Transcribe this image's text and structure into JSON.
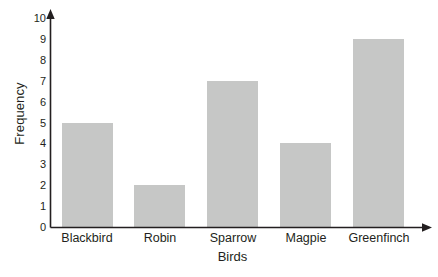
{
  "chart_data": {
    "type": "bar",
    "title": "",
    "subtitle": "",
    "categories": [
      "Blackbird",
      "Robin",
      "Sparrow",
      "Magpie",
      "Greenfinch"
    ],
    "values": [
      5,
      2,
      7,
      4,
      9
    ],
    "xlabel": "Birds",
    "ylabel": "Frequency",
    "ylim": [
      0,
      10
    ],
    "ytick_labels": [
      "0",
      "1",
      "2",
      "3",
      "4",
      "5",
      "6",
      "7",
      "8",
      "9",
      "10"
    ],
    "ytick_values": [
      0,
      1,
      2,
      3,
      4,
      5,
      6,
      7,
      8,
      9,
      10
    ],
    "grid": false,
    "legend": false,
    "legend_position": "none",
    "bar_color": "#c6c7c6",
    "axis_color": "#231f20",
    "background_color": "#ffffff",
    "axis_arrows": true
  },
  "axis": {
    "y_arrow_name": "y-axis-arrowhead",
    "x_arrow_name": "x-axis-arrowhead"
  }
}
